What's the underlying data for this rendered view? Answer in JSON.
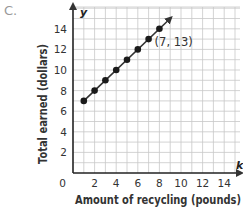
{
  "option_label": "C.",
  "chart_data": {
    "type": "scatter",
    "title": "",
    "xlabel": "Amount of recycling (pounds)",
    "ylabel": "Total earned (dollars)",
    "x_axis_var": "k",
    "y_axis_var": "y",
    "x": [
      1,
      2,
      3,
      4,
      5,
      6,
      7,
      8
    ],
    "y": [
      7,
      8,
      9,
      10,
      11,
      12,
      13,
      14
    ],
    "connected": true,
    "arrow_at_end": true,
    "annotations": [
      {
        "x": 7,
        "y": 13,
        "text": "(7, 13)"
      }
    ],
    "xlim": [
      0,
      15
    ],
    "ylim": [
      0,
      16
    ],
    "x_ticks": [
      2,
      4,
      6,
      8,
      10,
      12,
      14
    ],
    "y_ticks": [
      2,
      4,
      6,
      8,
      10,
      12,
      14
    ],
    "origin_label": "0",
    "grid": true,
    "grid_step": 1
  },
  "colors": {
    "grid": "#c8c8c8",
    "axis": "#222222",
    "point": "#1a1a1a",
    "line": "#333333",
    "text": "#333333"
  }
}
